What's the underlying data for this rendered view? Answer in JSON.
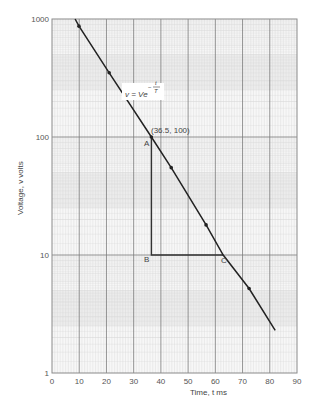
{
  "chart_data": {
    "type": "line",
    "title": "",
    "xlabel": "Time, t ms",
    "ylabel": "Voltage, v volts",
    "xscale": "linear",
    "yscale": "log",
    "xlim": [
      0,
      90
    ],
    "ylim": [
      1,
      1000
    ],
    "xticks": [
      "0",
      "10",
      "20",
      "30",
      "40",
      "50",
      "60",
      "70",
      "80",
      "90"
    ],
    "yticks": [
      "1",
      "10",
      "100",
      "1000"
    ],
    "grid": true,
    "series": [
      {
        "name": "v = Ve^(-t/T)",
        "x": [
          8.5,
          9.9,
          21.0,
          36.5,
          43.8,
          56.6,
          62.9,
          72.4,
          82.0
        ],
        "y": [
          1000,
          870,
          350,
          100,
          55,
          18,
          10,
          5.2,
          2.3
        ],
        "markers_at_index": [
          1,
          2,
          3,
          4,
          5,
          7
        ]
      }
    ],
    "annotations": [
      {
        "text": "v = Ve^(-t/T)",
        "x": 27,
        "y": 330
      },
      {
        "text": "(36.5, 100)",
        "x": 36.5,
        "y": 100
      },
      {
        "text": "A",
        "x": 36.5,
        "y": 100
      },
      {
        "text": "B",
        "x": 36.5,
        "y": 10
      },
      {
        "text": "C",
        "x": 62.9,
        "y": 10
      }
    ],
    "triangle": {
      "A": [
        36.5,
        100
      ],
      "B": [
        36.5,
        10
      ],
      "C": [
        62.9,
        10
      ]
    }
  },
  "labels": {
    "xlabel": "Time, t ms",
    "ylabel": "Voltage, v volts",
    "formula_main": "v = Ve",
    "formula_exp_num": "t",
    "formula_exp_den": "T",
    "formula_exp_sign": "−",
    "point_label": "(36.5, 100)",
    "A": "A",
    "B": "B",
    "C": "C"
  },
  "colors": {
    "line": "#222222",
    "major_grid": "#7a7a7a",
    "minor_grid": "#d6d6d6",
    "band": "#ececec"
  }
}
